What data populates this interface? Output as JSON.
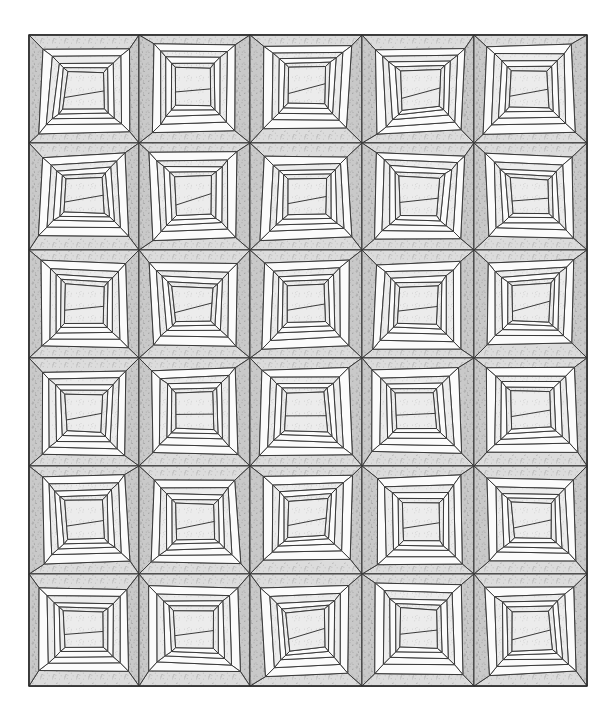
{
  "diagram": {
    "type": "quilt-layout",
    "style": "wonky log cabin",
    "grid": {
      "columns": 5,
      "rows": 6
    },
    "bounds": {
      "x": 29,
      "y": 35,
      "width": 558,
      "height": 651
    },
    "col_edges": [
      29,
      139,
      250,
      362,
      474,
      587
    ],
    "row_edges": [
      35,
      143,
      250,
      358,
      466,
      574,
      686
    ],
    "colors": {
      "background": "#ffffff",
      "outline": "#3a3a3a",
      "dark_fabric": "#c9c9c9",
      "medium_fabric": "#dcdcdc",
      "light_fabric": "#ececec",
      "white_strip": "#fbfbfb"
    },
    "fabric_sequence": [
      "light_fabric",
      "white_strip",
      "light_fabric",
      "white_strip",
      "medium_fabric",
      "dark_fabric"
    ],
    "blocks_note": "Each block is a skewed log-cabin: off-center trapezoid center surrounded by rings of strips, alternating light/white, outer ring of gray print."
  }
}
